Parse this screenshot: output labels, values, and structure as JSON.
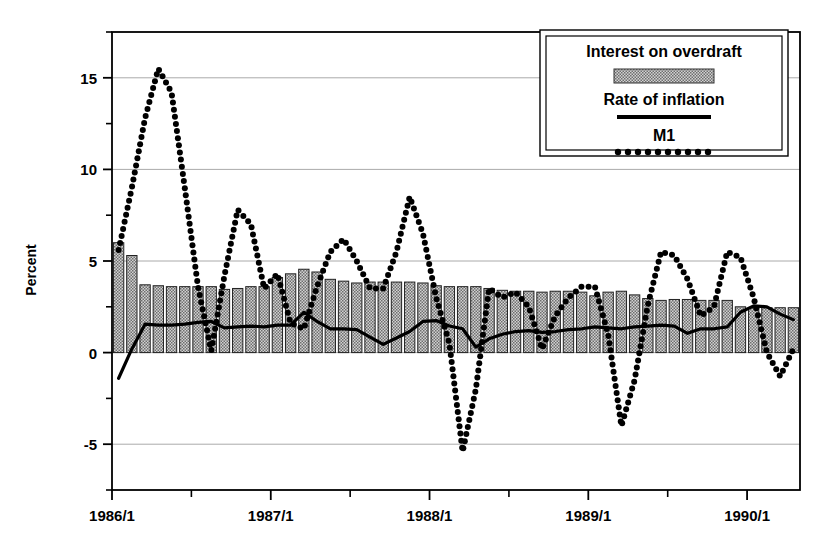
{
  "chart_data": {
    "type": "bar",
    "title": "",
    "xlabel": "",
    "ylabel": "Percent",
    "ylim": [
      -7.5,
      17.5
    ],
    "yticks": [
      -5,
      0,
      5,
      10,
      15
    ],
    "ytick_labels": [
      "-5",
      "0",
      "5",
      "10",
      "15"
    ],
    "y_minor_ticks": [
      -7.5,
      -2.5,
      2.5,
      7.5,
      12.5,
      17.5
    ],
    "grid": "horizontal",
    "xlim_labels": [
      "1986/1",
      "1987/1",
      "1988/1",
      "1989/1",
      "1990/1"
    ],
    "xtick_months": [
      0,
      12,
      24,
      36,
      48
    ],
    "x_minor_tick_months": [
      6,
      18,
      30,
      42
    ],
    "x_start": "1986/1",
    "x_end": "1990/4",
    "n_points": 52,
    "legend_position": "top-right",
    "legend_entries": [
      {
        "label": "Interest on overdraft",
        "marker": "filled-bar-swatch"
      },
      {
        "label": "Rate of inflation",
        "marker": "solid-line"
      },
      {
        "label": "M1",
        "marker": "dotted-line"
      }
    ],
    "series": [
      {
        "name": "Interest on overdraft",
        "kind": "bar",
        "values": [
          6.0,
          5.3,
          3.7,
          3.65,
          3.6,
          3.6,
          3.6,
          3.6,
          3.45,
          3.5,
          3.6,
          3.6,
          4.1,
          4.3,
          4.55,
          4.4,
          4.0,
          3.9,
          3.8,
          3.85,
          3.85,
          3.85,
          3.85,
          3.8,
          3.65,
          3.6,
          3.6,
          3.6,
          3.5,
          3.4,
          3.35,
          3.35,
          3.3,
          3.35,
          3.35,
          3.3,
          3.1,
          3.3,
          3.35,
          3.15,
          2.95,
          2.85,
          2.9,
          2.9,
          2.85,
          2.85,
          2.85,
          2.5,
          2.45,
          2.45,
          2.45,
          2.45
        ]
      },
      {
        "name": "Rate of inflation",
        "kind": "line",
        "style": "solid",
        "values": [
          -1.4,
          0.2,
          1.55,
          1.5,
          1.5,
          1.55,
          1.65,
          1.7,
          1.35,
          1.4,
          1.45,
          1.4,
          1.5,
          1.5,
          2.2,
          1.7,
          1.3,
          1.3,
          1.25,
          0.85,
          0.45,
          0.8,
          1.15,
          1.7,
          1.75,
          1.45,
          1.3,
          0.3,
          0.75,
          1.0,
          1.15,
          1.2,
          1.1,
          1.15,
          1.25,
          1.3,
          1.4,
          1.35,
          1.3,
          1.4,
          1.45,
          1.5,
          1.45,
          1.05,
          1.3,
          1.3,
          1.4,
          2.2,
          2.55,
          2.5,
          2.1,
          1.8
        ],
        "line_points_extra": [
          2.1,
          2.3,
          2.2,
          1.4,
          1.6,
          1.6,
          1.05,
          1.3,
          1.3,
          2.0,
          1.85,
          1.55,
          0.9,
          1.2,
          2.1,
          1.55,
          2.3,
          4.7,
          2.1,
          1.0,
          1.5,
          2.5,
          1.8,
          1.35,
          1.45,
          1.3,
          1.45,
          1.8,
          1.9,
          1.75,
          1.5,
          1.3,
          1.1,
          0.75,
          1.1
        ]
      },
      {
        "name": "M1",
        "kind": "line",
        "style": "dotted",
        "values": [
          5.6,
          9.0,
          12.8,
          15.5,
          14.2,
          9.0,
          3.6,
          0.1,
          4.2,
          7.8,
          7.0,
          3.5,
          4.3,
          1.6,
          1.3,
          3.6,
          5.5,
          6.2,
          5.0,
          3.5,
          3.5,
          5.5,
          8.5,
          6.5,
          3.0,
          0.5,
          -5.4,
          -2.0,
          3.5,
          3.0,
          3.3,
          2.5,
          0.2,
          2.0,
          3.0,
          3.6,
          3.6,
          1.0,
          -4.0,
          -1.5,
          2.6,
          5.5,
          5.3,
          4.0,
          2.0,
          2.5,
          5.5,
          5.2,
          3.0,
          0.0,
          -1.3,
          0.2
        ]
      }
    ]
  },
  "legend": {
    "items": [
      {
        "label": "Interest on overdraft",
        "swatch": "bar-swatch"
      },
      {
        "label": "Rate of inflation",
        "swatch": "solid-line-swatch"
      },
      {
        "label": "M1",
        "swatch": "dotted-line-swatch"
      }
    ]
  },
  "axes": {
    "y_title": "Percent",
    "y_tick_labels": [
      "15",
      "10",
      "5",
      "0",
      "-5"
    ],
    "x_tick_labels": [
      "1986/1",
      "1987/1",
      "1988/1",
      "1989/1",
      "1990/1"
    ]
  },
  "colors": {
    "axis": "#000000",
    "grid": "#aaaaaa",
    "bar_fill": "#b9b9b9",
    "bar_edge": "#222222",
    "line": "#000000",
    "background": "#ffffff"
  }
}
